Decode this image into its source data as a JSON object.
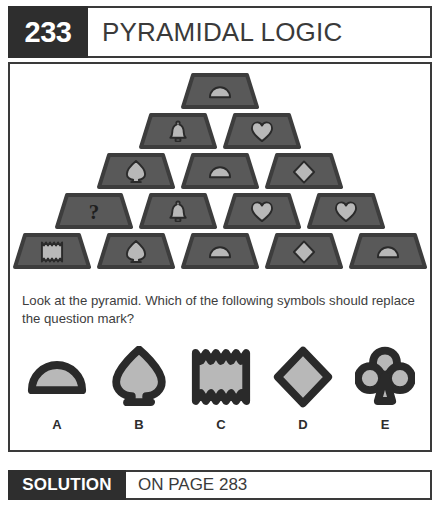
{
  "header": {
    "number": "233",
    "title": "PYRAMIDAL LOGIC"
  },
  "colors": {
    "dark": "#2e2e2e",
    "tile_fill": "#595959",
    "tile_edge": "#3d3d3d",
    "symbol_light": "#b8b8b8",
    "symbol_dark": "#2a2a2a",
    "page_bg": "#ffffff",
    "text": "#3d3d3d"
  },
  "puzzle": {
    "question": "Look at the pyramid. Which of the following symbols should replace the question mark?",
    "pyramid": {
      "rows": [
        {
          "index": 1,
          "tiles": [
            {
              "symbol": "dome",
              "label": "dome-symbol"
            }
          ]
        },
        {
          "index": 2,
          "tiles": [
            {
              "symbol": "bell",
              "label": "bell-symbol"
            },
            {
              "symbol": "heart",
              "label": "heart-symbol"
            }
          ]
        },
        {
          "index": 3,
          "tiles": [
            {
              "symbol": "spade",
              "label": "spade-symbol"
            },
            {
              "symbol": "dome",
              "label": "dome-symbol"
            },
            {
              "symbol": "diamond",
              "label": "diamond-symbol"
            }
          ]
        },
        {
          "index": 4,
          "tiles": [
            {
              "symbol": "question",
              "label": "question-mark"
            },
            {
              "symbol": "bell",
              "label": "bell-symbol"
            },
            {
              "symbol": "heart",
              "label": "heart-symbol"
            },
            {
              "symbol": "heart",
              "label": "heart-symbol"
            }
          ]
        },
        {
          "index": 5,
          "tiles": [
            {
              "symbol": "zigzag",
              "label": "zigzag-symbol"
            },
            {
              "symbol": "spade",
              "label": "spade-symbol"
            },
            {
              "symbol": "dome",
              "label": "dome-symbol"
            },
            {
              "symbol": "diamond",
              "label": "diamond-symbol"
            },
            {
              "symbol": "dome",
              "label": "dome-symbol"
            }
          ]
        }
      ]
    },
    "options": [
      {
        "letter": "A",
        "symbol": "dome"
      },
      {
        "letter": "B",
        "symbol": "spade"
      },
      {
        "letter": "C",
        "symbol": "zigzag"
      },
      {
        "letter": "D",
        "symbol": "diamond"
      },
      {
        "letter": "E",
        "symbol": "club"
      }
    ]
  },
  "solution": {
    "label": "SOLUTION",
    "page_text": "ON PAGE 283"
  }
}
